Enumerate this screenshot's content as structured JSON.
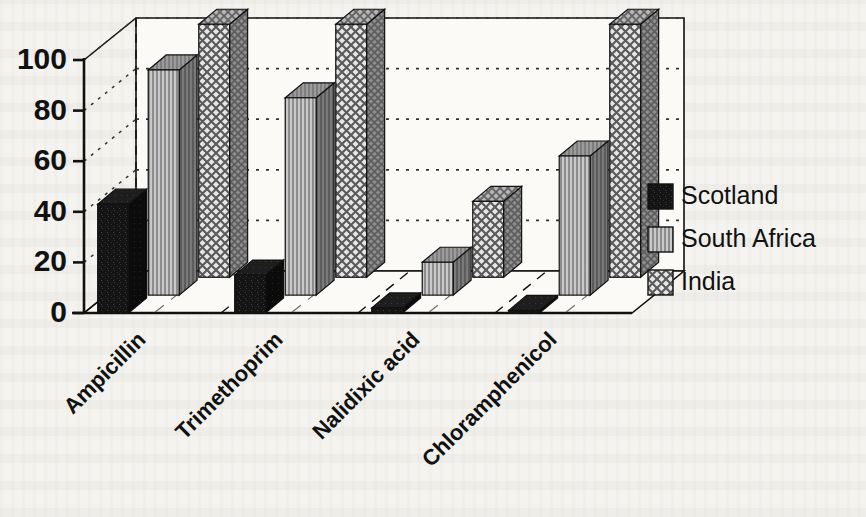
{
  "chart_data": {
    "type": "bar",
    "title": "",
    "subtitle": "",
    "xlabel": "",
    "ylabel": "",
    "ylim": [
      0,
      100
    ],
    "yticks": [
      0,
      20,
      40,
      60,
      80,
      100
    ],
    "ytick_labels": [
      "0",
      "20",
      "40",
      "60",
      "80",
      "100"
    ],
    "categories": [
      "Ampicillin",
      "Trimethoprim",
      "Nalidixic acid",
      "Chloramphenicol"
    ],
    "series": [
      {
        "name": "Scotland",
        "pattern": "solid-black",
        "values": [
          43,
          15,
          2,
          1
        ]
      },
      {
        "name": "South Africa",
        "pattern": "vertical-stripes",
        "values": [
          89,
          78,
          13,
          55
        ]
      },
      {
        "name": "India",
        "pattern": "crosshatch",
        "values": [
          100,
          100,
          30,
          100
        ]
      }
    ],
    "grid": true,
    "grid_style": "dotted-horizontal",
    "projection": "3d-isometric",
    "legend_position": "right",
    "legend_entries": [
      "Scotland",
      "South Africa",
      "India"
    ],
    "colors": {
      "background": "#f4f3ef",
      "axis": "#111111",
      "grid": "#333333",
      "scotland_fill": "#141414",
      "south_africa_fill": "#9a9a9a",
      "india_fill": "#d8d8d8",
      "side_shade": "#6f6f6f",
      "top_shade": "#8c8c8c"
    }
  },
  "axes": {
    "y_axis_name": "y-axis",
    "x_axis_name": "x-axis"
  }
}
